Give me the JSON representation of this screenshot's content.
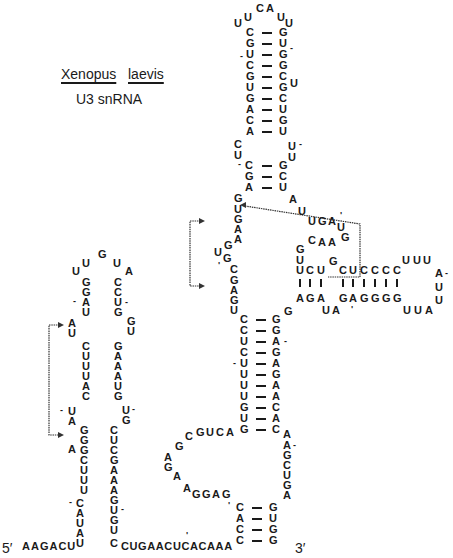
{
  "title": {
    "genus": "Xenopus",
    "species": "laevis",
    "subtitle": "U3 snRNA"
  },
  "ends": {
    "five_prime": "5′",
    "three_prime": "3′"
  },
  "tail5": "AAGACU",
  "linker": "CUGAACUCACAAA",
  "top_hairpin": {
    "loop": [
      "U",
      "U",
      "C",
      "A",
      "U",
      "U"
    ],
    "left": [
      "C",
      "G",
      "U",
      "C",
      "G",
      "U",
      "G",
      "A",
      "C",
      "A"
    ],
    "right": [
      "G",
      "U",
      "G",
      "G",
      "C",
      "G",
      "C",
      "U",
      "G",
      "U"
    ],
    "bulge_right": "U"
  },
  "mid": {
    "left_int": [
      "C",
      "U"
    ],
    "right_int": [
      "U",
      "U"
    ],
    "left": [
      "C",
      "G",
      "A"
    ],
    "right": [
      "G",
      "C",
      "U"
    ]
  },
  "boxes": {
    "left_strand": [
      "G",
      "U",
      "G",
      "A",
      "A",
      "G",
      "U",
      "G",
      "C",
      "G",
      "A",
      "G",
      "U"
    ],
    "right_strand": [
      "A",
      "U",
      "U",
      "G",
      "A",
      "U",
      "G",
      "A",
      "A",
      "C",
      "G"
    ]
  },
  "side_hairpin": {
    "top": [
      "U",
      "C",
      "U",
      "G",
      "C",
      "U",
      "C",
      "C",
      "C",
      "C",
      "U",
      "U",
      "U",
      "A"
    ],
    "bottom": [
      "A",
      "G",
      "A",
      "U",
      "A",
      "G",
      "A",
      "G",
      "G",
      "G",
      "G",
      "U",
      "U",
      "A",
      "U",
      "U"
    ]
  },
  "stem3": {
    "left": [
      "C",
      "C",
      "U",
      "C",
      "U",
      "U",
      "U",
      "U",
      "G",
      "U",
      "G"
    ],
    "right": [
      "G",
      "G",
      "A",
      "G",
      "A",
      "G",
      "A",
      "A",
      "C",
      "A",
      "C"
    ]
  },
  "lower_loop": {
    "left": "GUCA",
    "left2": [
      "C",
      "G",
      "A",
      "G",
      "A",
      "A",
      "GGAG"
    ],
    "right": [
      "A",
      "A",
      "G",
      "C",
      "U",
      "G",
      "A"
    ]
  },
  "stem4": {
    "left": [
      "C",
      "A",
      "C",
      "C"
    ],
    "right": [
      "G",
      "U",
      "G",
      "G"
    ]
  },
  "left_hairpin": {
    "loop": [
      "U",
      "U",
      "G",
      "U",
      "A"
    ],
    "left": [
      "G",
      "G",
      "A",
      "U",
      "A",
      "U",
      "C",
      "U",
      "U",
      "U",
      "A",
      "C",
      "U",
      "A",
      "G",
      "G",
      "A",
      "C",
      "U",
      "U",
      "U",
      "C",
      "A",
      "U",
      "A",
      "U"
    ],
    "right": [
      "C",
      "C",
      "U",
      "G",
      "G",
      "U",
      "G",
      "A",
      "A",
      "A",
      "U",
      "G",
      "U",
      "G",
      "C",
      "U",
      "C",
      "G",
      "A",
      "A",
      "A",
      "G",
      "U",
      "G",
      "U",
      "C"
    ]
  }
}
